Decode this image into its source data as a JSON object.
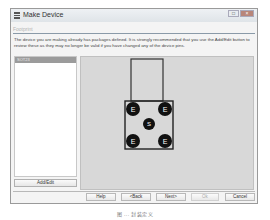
{
  "window": {
    "title": "Make Device",
    "controls": {
      "minimize": "-",
      "maximize": "□",
      "close": "×"
    }
  },
  "subheading": "Footprint",
  "description": "The device you are making already has packages defined. It is strongly recommended that you use the Add/Edit button to review these as they may no longer be valid if you have changed any of the device pins.",
  "package_list": {
    "items": [
      {
        "label": "SOT23",
        "selected": true
      }
    ],
    "add_edit_label": "Add/Edit"
  },
  "footprint": {
    "pads": [
      {
        "label": "E",
        "position": "top-left"
      },
      {
        "label": "E",
        "position": "top-right"
      },
      {
        "label": "S",
        "position": "center"
      },
      {
        "label": "E",
        "position": "bottom-left"
      },
      {
        "label": "E",
        "position": "bottom-right"
      }
    ]
  },
  "buttons": {
    "help": "Help",
    "back": "<Back",
    "next": "Next>",
    "ok": "Ok",
    "cancel": "Cancel"
  },
  "caption": "图 ... 封装定义"
}
